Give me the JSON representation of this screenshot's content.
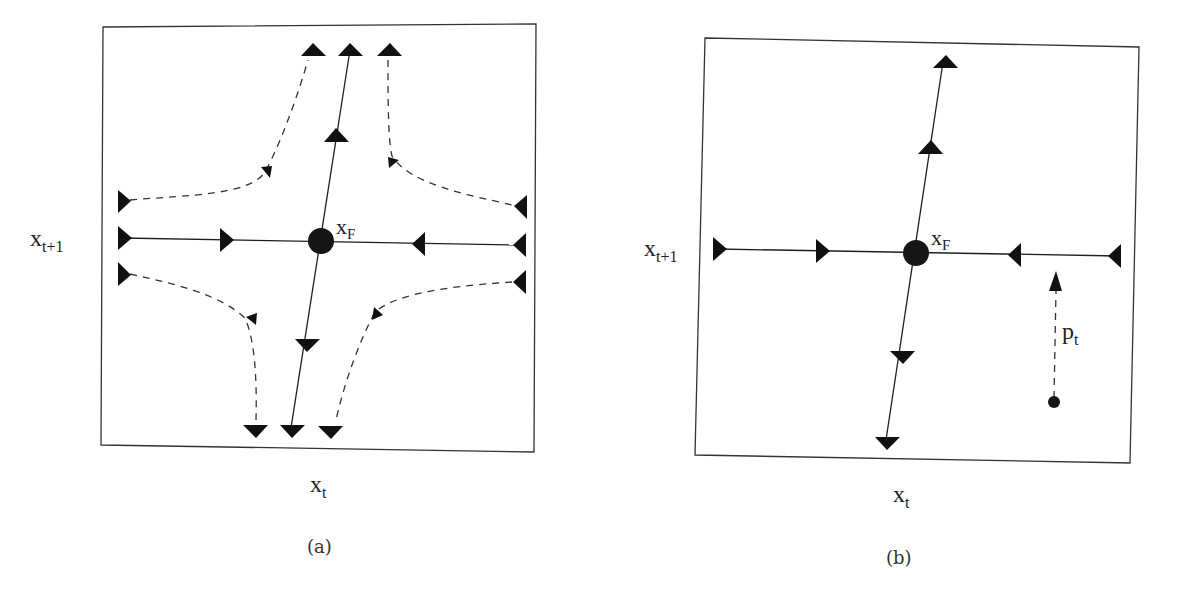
{
  "figure": {
    "panels": [
      {
        "id": "a",
        "caption": "(a)",
        "x_axis_label": "x",
        "x_axis_sub": "t",
        "y_axis_label": "x",
        "y_axis_sub": "t+1",
        "fixed_point_label": "x",
        "fixed_point_sub": "F",
        "description": "Saddle fixed point with stable manifold (horizontal, arrows pointing inward) and unstable manifold (near-vertical, arrows pointing outward), plus four dashed hyperbolic trajectories"
      },
      {
        "id": "b",
        "caption": "(b)",
        "x_axis_label": "x",
        "x_axis_sub": "t",
        "y_axis_label": "x",
        "y_axis_sub": "t+1",
        "fixed_point_label": "x",
        "fixed_point_sub": "F",
        "perturbation_label": "p",
        "perturbation_sub": "t",
        "description": "Saddle fixed point with stable and unstable manifolds; a dashed perturbation p_t moves a point onto the stable manifold"
      }
    ],
    "colors": {
      "ink": "#1a1a1a",
      "frame": "#333333",
      "background": "#ffffff"
    }
  }
}
